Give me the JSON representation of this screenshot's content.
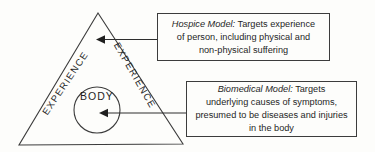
{
  "diagram": {
    "triangle_left_edge_label": "EXPERIENCE",
    "triangle_right_edge_label": "EXPERIENCE",
    "circle_label": "BODY"
  },
  "boxes": [
    {
      "title": "Hospice Model:",
      "lines": [
        " Targets experience",
        "of person, including physical and",
        "non-physical suffering"
      ]
    },
    {
      "title": "Biomedical Model:",
      "lines": [
        " Targets",
        "underlying causes of symptoms,",
        "presumed to be diseases and injuries",
        "in the body"
      ]
    }
  ],
  "colors": {
    "line": "#3c3c3c",
    "text": "#1f1f1f",
    "background": "#fdfdfb"
  }
}
